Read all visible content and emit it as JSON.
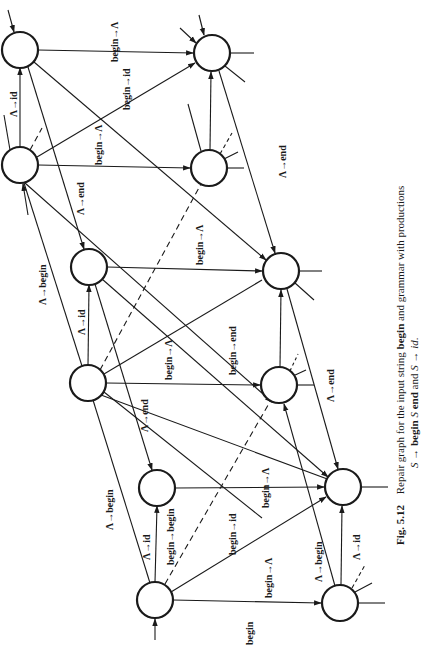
{
  "figure": {
    "caption_number": "Fig. 5.12",
    "caption_line1": "Repair graph for the input string begin and grammar with productions",
    "caption_line2": "S → begin S end and S → id.",
    "caption_parts": {
      "prefix": "Repair graph for the input string ",
      "input_string": "begin",
      "middle": " and grammar with productions",
      "prod1_lhs": "S → ",
      "prod1_rhs_a": "begin",
      "prod1_rhs_b": " S ",
      "prod1_rhs_c": "end",
      "and": " and ",
      "prod2": "S → ",
      "prod2_rhs": "id",
      "period": "."
    },
    "orientation": "rotated 90 degrees counter-clockwise"
  },
  "diagram": {
    "colors": {
      "ink": "#1a1a1a",
      "background": "#ffffff"
    },
    "nodes": [
      {
        "id": "n1",
        "cx": 20,
        "cy": 50
      },
      {
        "id": "n2",
        "cx": 20,
        "cy": 165
      },
      {
        "id": "n3",
        "cx": 89,
        "cy": 267
      },
      {
        "id": "n4",
        "cx": 88,
        "cy": 383
      },
      {
        "id": "n5",
        "cx": 157,
        "cy": 488
      },
      {
        "id": "n6",
        "cx": 155,
        "cy": 600
      },
      {
        "id": "n7",
        "cx": 212,
        "cy": 53
      },
      {
        "id": "n8",
        "cx": 209,
        "cy": 168
      },
      {
        "id": "n9",
        "cx": 281,
        "cy": 271
      },
      {
        "id": "n10",
        "cx": 279,
        "cy": 385
      },
      {
        "id": "n11",
        "cx": 343,
        "cy": 487
      },
      {
        "id": "n12",
        "cx": 340,
        "cy": 603
      }
    ],
    "labels": [
      {
        "text": "begin→Λ",
        "x": 118,
        "y": 50
      },
      {
        "text": "begin→id",
        "x": 130,
        "y": 100
      },
      {
        "text": "Λ→id",
        "x": 13,
        "y": 105
      },
      {
        "text": "begin→Λ",
        "x": 104,
        "y": 147
      },
      {
        "text": "Λ→end",
        "x": 83,
        "y": 195
      },
      {
        "text": "Λ→end",
        "x": 285,
        "y": 145
      },
      {
        "text": "Λ→begin",
        "x": 43,
        "y": 300
      },
      {
        "text": "Λ→id",
        "x": 83,
        "y": 325
      },
      {
        "text": "begin→Λ",
        "x": 199,
        "y": 245
      },
      {
        "text": "begin→Λ",
        "x": 170,
        "y": 360
      },
      {
        "text": "begin→end",
        "x": 235,
        "y": 335
      },
      {
        "text": "Λ→end",
        "x": 145,
        "y": 420
      },
      {
        "text": "Λ→end",
        "x": 332,
        "y": 370
      },
      {
        "text": "Λ→begin",
        "x": 112,
        "y": 520
      },
      {
        "text": "Λ→id",
        "x": 150,
        "y": 545
      },
      {
        "text": "begin→begin",
        "x": 172,
        "y": 540
      },
      {
        "text": "begin→Λ",
        "x": 270,
        "y": 483
      },
      {
        "text": "begin→id",
        "x": 236,
        "y": 540
      },
      {
        "text": "begin→Λ",
        "x": 270,
        "y": 600
      },
      {
        "text": "Λ→begin",
        "x": 321,
        "y": 565
      },
      {
        "text": "Λ→id",
        "x": 357,
        "y": 545
      },
      {
        "text": "begin",
        "x": 240,
        "y": 622
      }
    ]
  }
}
